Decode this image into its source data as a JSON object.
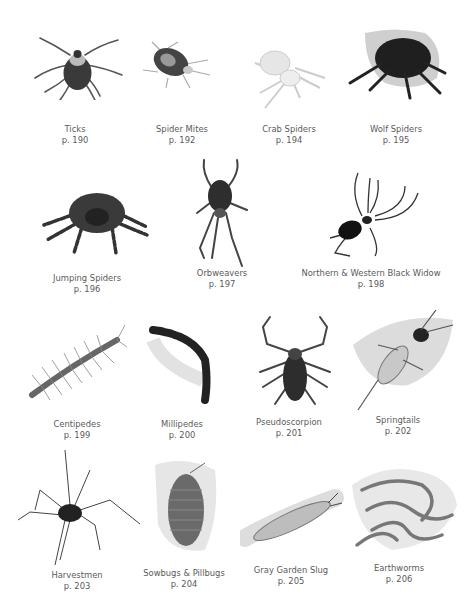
{
  "page": {
    "background": "#ffffff",
    "caption_color": "#5a5a5a"
  },
  "rows": [
    {
      "items": [
        {
          "name": "Ticks",
          "page": "p. 190"
        },
        {
          "name": "Spider Mites",
          "page": "p. 192"
        },
        {
          "name": "Crab Spiders",
          "page": "p. 194"
        },
        {
          "name": "Wolf Spiders",
          "page": "p. 195"
        }
      ]
    },
    {
      "items": [
        {
          "name": "Jumping Spiders",
          "page": "p. 196"
        },
        {
          "name": "Orbweavers",
          "page": "p. 197"
        },
        {
          "name": "Northern & Western Black Widow",
          "page": "p. 198"
        }
      ]
    },
    {
      "items": [
        {
          "name": "Centipedes",
          "page": "p. 199"
        },
        {
          "name": "Millipedes",
          "page": "p. 200"
        },
        {
          "name": "Pseudoscorpion",
          "page": "p. 201"
        },
        {
          "name": "Springtails",
          "page": "p. 202"
        }
      ]
    },
    {
      "items": [
        {
          "name": "Harvestmen",
          "page": "p. 203"
        },
        {
          "name": "Sowbugs & Pillbugs",
          "page": "p. 204"
        },
        {
          "name": "Gray Garden Slug",
          "page": "p. 205"
        },
        {
          "name": "Earthworms",
          "page": "p. 206"
        }
      ]
    }
  ]
}
